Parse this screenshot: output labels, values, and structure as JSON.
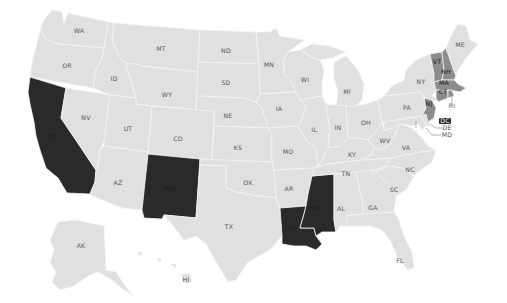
{
  "map": {
    "type": "choropleth",
    "region": "United States",
    "colors": {
      "background": "#ffffff",
      "category_dark": "#2a2a2a",
      "category_medium": "#8c8c8c",
      "category_light": "#e0e0e0",
      "label": "#555555",
      "border": "#f4f4f4"
    },
    "states": {
      "WA": {
        "label": "WA",
        "category": "light"
      },
      "OR": {
        "label": "OR",
        "category": "light"
      },
      "CA": {
        "label": "CA",
        "category": "dark"
      },
      "ID": {
        "label": "ID",
        "category": "light"
      },
      "NV": {
        "label": "NV",
        "category": "light"
      },
      "MT": {
        "label": "MT",
        "category": "light"
      },
      "WY": {
        "label": "WY",
        "category": "light"
      },
      "UT": {
        "label": "UT",
        "category": "light"
      },
      "AZ": {
        "label": "AZ",
        "category": "light"
      },
      "CO": {
        "label": "CO",
        "category": "light"
      },
      "NM": {
        "label": "NM",
        "category": "dark"
      },
      "ND": {
        "label": "ND",
        "category": "light"
      },
      "SD": {
        "label": "SD",
        "category": "light"
      },
      "NE": {
        "label": "NE",
        "category": "light"
      },
      "KS": {
        "label": "KS",
        "category": "light"
      },
      "OK": {
        "label": "OK",
        "category": "light"
      },
      "TX": {
        "label": "TX",
        "category": "light"
      },
      "MN": {
        "label": "MN",
        "category": "light"
      },
      "IA": {
        "label": "IA",
        "category": "light"
      },
      "MO": {
        "label": "MO",
        "category": "light"
      },
      "AR": {
        "label": "AR",
        "category": "light"
      },
      "LA": {
        "label": "LA",
        "category": "dark"
      },
      "WI": {
        "label": "WI",
        "category": "light"
      },
      "IL": {
        "label": "IL",
        "category": "light"
      },
      "MS": {
        "label": "MS",
        "category": "dark"
      },
      "MI": {
        "label": "MI",
        "category": "light"
      },
      "IN": {
        "label": "IN",
        "category": "light"
      },
      "KY": {
        "label": "KY",
        "category": "light"
      },
      "TN": {
        "label": "TN",
        "category": "light"
      },
      "AL": {
        "label": "AL",
        "category": "light"
      },
      "OH": {
        "label": "OH",
        "category": "light"
      },
      "WV": {
        "label": "WV",
        "category": "light"
      },
      "GA": {
        "label": "GA",
        "category": "light"
      },
      "FL": {
        "label": "FL",
        "category": "light"
      },
      "SC": {
        "label": "SC",
        "category": "light"
      },
      "NC": {
        "label": "NC",
        "category": "light"
      },
      "VA": {
        "label": "VA",
        "category": "light"
      },
      "PA": {
        "label": "PA",
        "category": "light"
      },
      "NY": {
        "label": "NY",
        "category": "light"
      },
      "VT": {
        "label": "VT",
        "category": "medium"
      },
      "NH": {
        "label": "NH",
        "category": "medium"
      },
      "ME": {
        "label": "ME",
        "category": "light"
      },
      "MA": {
        "label": "MA",
        "category": "medium"
      },
      "CT": {
        "label": "CT",
        "category": "medium"
      },
      "RI": {
        "label": "RI",
        "category": "medium"
      },
      "NJ": {
        "label": "NJ",
        "category": "medium"
      },
      "DE": {
        "label": "DE",
        "category": "light"
      },
      "MD": {
        "label": "MD",
        "category": "light"
      },
      "DC": {
        "label": "DC",
        "category": "dark"
      },
      "AK": {
        "label": "AK",
        "category": "light"
      },
      "HI": {
        "label": "HI",
        "category": "light"
      }
    }
  }
}
